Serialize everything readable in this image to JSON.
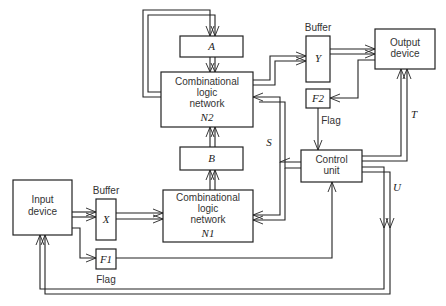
{
  "diagram": {
    "type": "block-diagram",
    "blocks": {
      "input_device": {
        "line1": "Input",
        "line2": "device"
      },
      "output_device": {
        "line1": "Output",
        "line2": "device"
      },
      "buffer_x": {
        "label": "X",
        "caption": "Buffer"
      },
      "buffer_y": {
        "label": "Y",
        "caption": "Buffer"
      },
      "flag_f1": {
        "label": "F1",
        "caption": "Flag"
      },
      "flag_f2": {
        "label": "F2",
        "caption": "Flag"
      },
      "register_a": {
        "label": "A"
      },
      "register_b": {
        "label": "B"
      },
      "network_n1": {
        "line1": "Combinational",
        "line2": "logic",
        "line3": "network",
        "id": "N1"
      },
      "network_n2": {
        "line1": "Combinational",
        "line2": "logic",
        "line3": "network",
        "id": "N2"
      },
      "control_unit": {
        "line1": "Control",
        "line2": "unit"
      }
    },
    "signals": {
      "s": "S",
      "t": "T",
      "u": "U"
    }
  }
}
